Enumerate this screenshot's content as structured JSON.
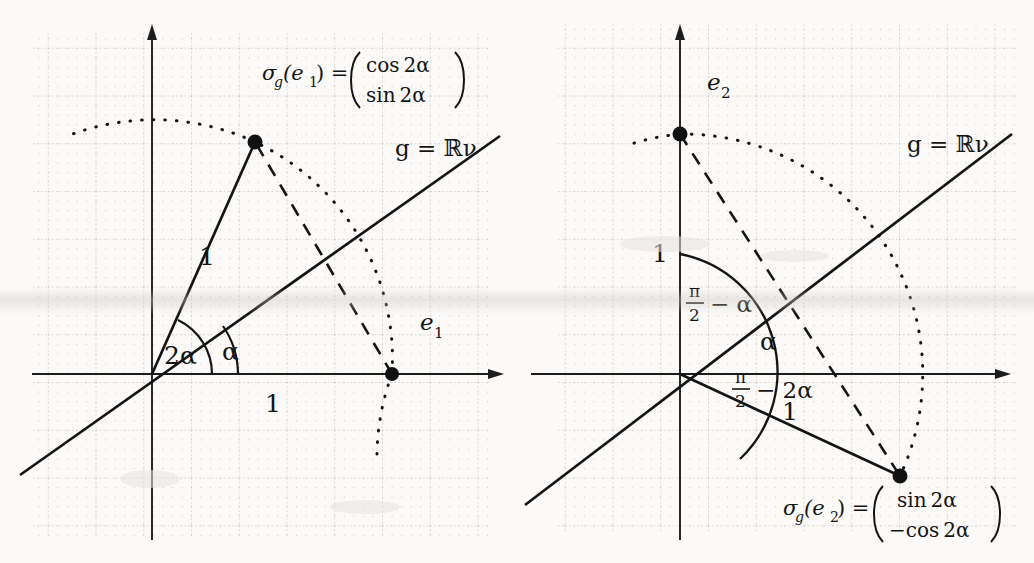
{
  "figure": {
    "kind": "geometry-diagram",
    "background": "#fbfaf8",
    "ink": "#141414",
    "grid_color": "#bdb9b4",
    "panels": [
      {
        "id": "left",
        "name": "reflection-of-e1",
        "labels": {
          "formula": "σg(e₁) = ( cos 2α , sin 2α )",
          "formula_lhs": "σ",
          "formula_lhs_sub": "g",
          "formula_arg": "(e",
          "formula_arg_sub": "1",
          "formula_arg_close": ") =",
          "matrix_row1": "cos 2α",
          "matrix_row2": "sin 2α",
          "line_label": "g = ℝν",
          "axis_label": "e₁",
          "axis_label_base": "e",
          "axis_label_sub": "1",
          "angle_double": "2α",
          "angle_single": "α",
          "length_slanted": "1",
          "length_horizontal": "1"
        },
        "geometry": {
          "origin": [
            152,
            374
          ],
          "unit_radius": 240,
          "alpha_deg": 33,
          "x_axis": [
            30,
            500
          ],
          "y_axis": [
            30,
            545
          ],
          "e1_point": [
            392,
            374
          ],
          "reflected_point": [
            255,
            142
          ],
          "g_line_from": [
            22,
            500
          ],
          "g_line_to": [
            498,
            140
          ]
        }
      },
      {
        "id": "right",
        "name": "reflection-of-e2",
        "labels": {
          "formula": "σg(e₂) = ( sin 2α , −cos 2α )",
          "formula_lhs": "σ",
          "formula_lhs_sub": "g",
          "formula_arg": "(e",
          "formula_arg_sub": "2",
          "formula_arg_close": ") =",
          "matrix_row1": "sin 2α",
          "matrix_row2": "−cos 2α",
          "line_label": "g = ℝν",
          "axis_label": "e₂",
          "axis_label_base": "e",
          "axis_label_sub": "2",
          "angle_upper_num": "π",
          "angle_upper_den": "2",
          "angle_upper_rest": "− α",
          "angle_middle": "α",
          "angle_lower_num": "π",
          "angle_lower_den": "2",
          "angle_lower_rest": "− 2α",
          "length_vertical": "1",
          "length_slanted": "1"
        },
        "geometry": {
          "origin": [
            163,
            374
          ],
          "unit_radius": 240,
          "alpha_deg": 33,
          "x_axis": [
            12,
            500
          ],
          "y_axis": [
            30,
            545
          ],
          "e2_point": [
            163,
            134
          ],
          "reflected_point": [
            383,
            476
          ],
          "g_line_from": [
            10,
            543
          ],
          "g_line_to": [
            498,
            140
          ]
        }
      }
    ]
  }
}
